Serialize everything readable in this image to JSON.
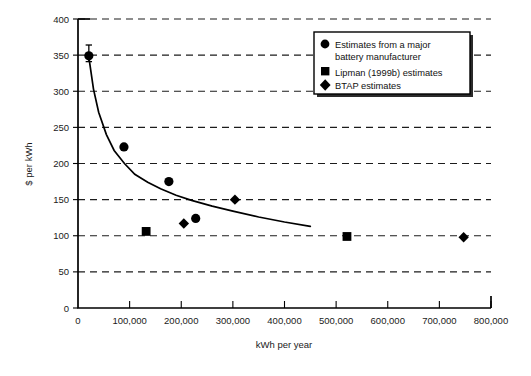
{
  "chart_data": {
    "type": "scatter",
    "title": "",
    "subtitle": "",
    "xlabel": "kWh per year",
    "ylabel": "$ per kWh",
    "xlim": [
      0,
      800000
    ],
    "ylim": [
      0,
      400
    ],
    "xticks": [
      0,
      100000,
      200000,
      300000,
      400000,
      500000,
      600000,
      700000,
      800000
    ],
    "xtick_labels": [
      "0",
      "100,000",
      "200,000",
      "300,000",
      "400,000",
      "500,000",
      "600,000",
      "700,000",
      "800,000"
    ],
    "yticks": [
      0,
      50,
      100,
      150,
      200,
      250,
      300,
      350,
      400
    ],
    "ytick_labels": [
      "0",
      "50",
      "100",
      "150",
      "200",
      "250",
      "300",
      "350",
      "400"
    ],
    "grid": "horizontal-dashed",
    "legend_position": "top-right-inside",
    "series": [
      {
        "name": "Estimates from a major battery manufacturer",
        "marker": "circle",
        "color": "#000000",
        "points": [
          {
            "x": 21000,
            "y": 349,
            "yerr_low": 341,
            "yerr_high": 364
          },
          {
            "x": 89000,
            "y": 223
          },
          {
            "x": 176000,
            "y": 175
          },
          {
            "x": 228000,
            "y": 124
          }
        ]
      },
      {
        "name": "Lipman (1999b) estimates",
        "marker": "square",
        "color": "#000000",
        "points": [
          {
            "x": 132000,
            "y": 106
          },
          {
            "x": 521000,
            "y": 99
          }
        ]
      },
      {
        "name": "BTAP estimates",
        "marker": "diamond",
        "color": "#000000",
        "points": [
          {
            "x": 205000,
            "y": 117
          },
          {
            "x": 304000,
            "y": 150
          },
          {
            "x": 747000,
            "y": 98
          }
        ]
      }
    ],
    "fit_curve": {
      "name": "fitted power-law trend",
      "style": "solid",
      "x_range": [
        20000,
        450000
      ],
      "points": [
        {
          "x": 20000,
          "y": 352
        },
        {
          "x": 30000,
          "y": 303
        },
        {
          "x": 40000,
          "y": 271
        },
        {
          "x": 55000,
          "y": 240
        },
        {
          "x": 70000,
          "y": 218
        },
        {
          "x": 90000,
          "y": 200
        },
        {
          "x": 110000,
          "y": 185
        },
        {
          "x": 135000,
          "y": 174
        },
        {
          "x": 160000,
          "y": 165
        },
        {
          "x": 190000,
          "y": 156
        },
        {
          "x": 220000,
          "y": 149
        },
        {
          "x": 260000,
          "y": 141
        },
        {
          "x": 300000,
          "y": 134
        },
        {
          "x": 350000,
          "y": 126
        },
        {
          "x": 400000,
          "y": 119
        },
        {
          "x": 450000,
          "y": 113
        }
      ]
    }
  },
  "legend": {
    "entries": [
      {
        "marker_icon": "filled-circle-icon",
        "label_line1": "Estimates from a major",
        "label_line2": "battery manufacturer"
      },
      {
        "marker_icon": "filled-square-icon",
        "label_line1": "Lipman (1999b) estimates",
        "label_line2": ""
      },
      {
        "marker_icon": "filled-diamond-icon",
        "label_line1": "BTAP estimates",
        "label_line2": ""
      }
    ]
  }
}
